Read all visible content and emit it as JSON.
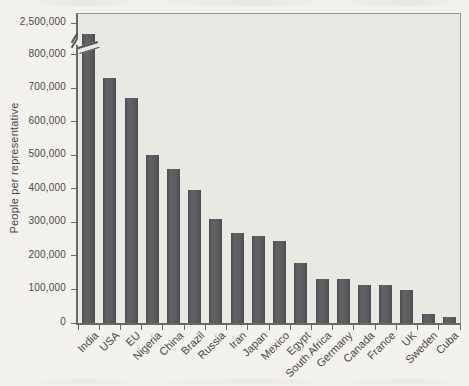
{
  "chart_data": {
    "type": "bar",
    "title": "",
    "xlabel": "",
    "ylabel": "People per representative",
    "categories": [
      "India",
      "USA",
      "EU",
      "Nigeria",
      "China",
      "Brazil",
      "Russia",
      "Iran",
      "Japan",
      "Mexico",
      "Egypt",
      "South Africa",
      "Germany",
      "Canada",
      "France",
      "UK",
      "Sweden",
      "Cuba"
    ],
    "values": [
      2500000,
      730000,
      670000,
      500000,
      460000,
      395000,
      310000,
      268000,
      260000,
      245000,
      180000,
      130000,
      130000,
      113000,
      113000,
      97000,
      28000,
      18000
    ],
    "ytick_values": [
      0,
      100000,
      200000,
      300000,
      400000,
      500000,
      600000,
      700000,
      800000
    ],
    "ytick_labels": [
      "0",
      "100,000",
      "200,000",
      "300,000",
      "400,000",
      "500,000",
      "600,000",
      "700,000",
      "800,000"
    ],
    "axis_break": {
      "label": "2,500,000",
      "value": 2500000,
      "linear_max": 800000
    },
    "ylim": [
      0,
      800000
    ],
    "grid": false,
    "legend": false
  },
  "colors": {
    "page_bg": "#f2f1ed",
    "plot_bg": "#e9e8e3",
    "bar": "#59585a",
    "axis": "#6a6862",
    "frame": "#97958f",
    "text": "#4c4a44"
  }
}
